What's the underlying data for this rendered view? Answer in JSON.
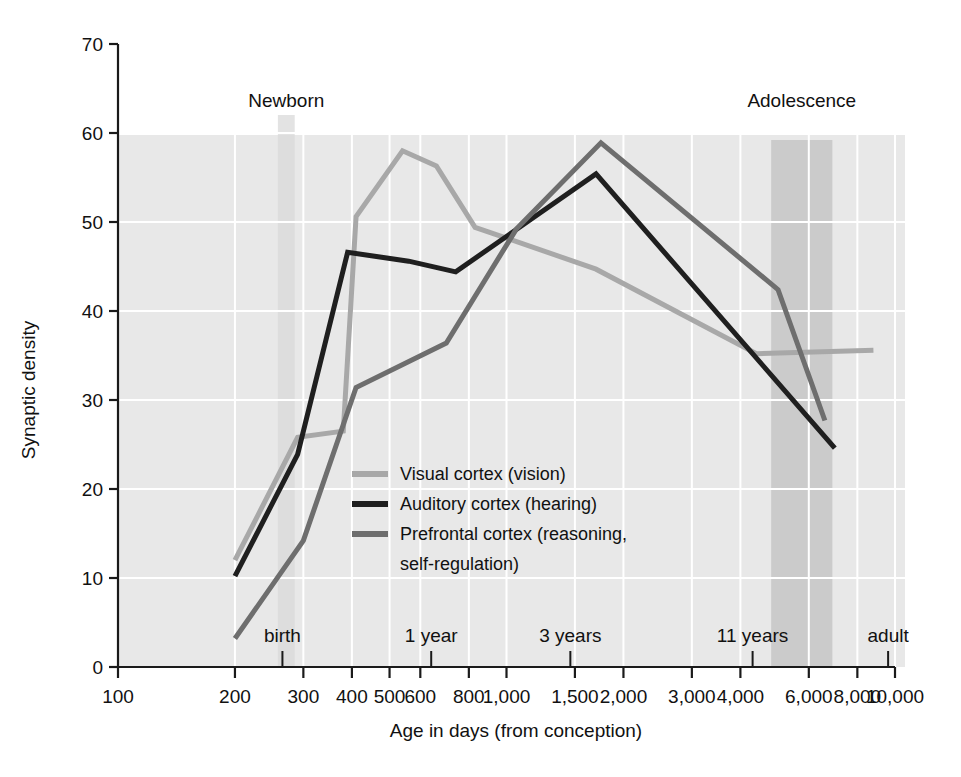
{
  "chart_data": {
    "type": "line",
    "title": "",
    "xlabel": "Age in days (from conception)",
    "ylabel": "Synaptic density",
    "xscale": "log",
    "xlim": [
      100,
      10000
    ],
    "ylim": [
      0,
      70
    ],
    "grid": true,
    "legend_position": "center-inside",
    "x_tick_labels": [
      "100",
      "200",
      "300",
      "400",
      "500",
      "600",
      "800",
      "1,000",
      "1,500",
      "2,000",
      "3,000",
      "4,000",
      "6,000",
      "8,000",
      "10,000"
    ],
    "x_tick_values": [
      100,
      200,
      300,
      400,
      500,
      600,
      800,
      1000,
      1500,
      2000,
      3000,
      4000,
      6000,
      8000,
      10000
    ],
    "y_tick_labels": [
      "0",
      "10",
      "20",
      "30",
      "40",
      "50",
      "60",
      "70"
    ],
    "y_tick_values": [
      0,
      10,
      20,
      30,
      40,
      50,
      60,
      70
    ],
    "stage_labels": [
      {
        "label": "birth",
        "x": 265
      },
      {
        "label": "1 year",
        "x": 640
      },
      {
        "label": "3 years",
        "x": 1460
      },
      {
        "label": "11 years",
        "x": 4300
      },
      {
        "label": "adult",
        "x": 9600
      }
    ],
    "bands": [
      {
        "label": "Newborn",
        "x_start": 258,
        "x_end": 285
      },
      {
        "label": "Adolescence",
        "x_start": 4800,
        "x_end": 6900
      }
    ],
    "series": [
      {
        "name": "Visual cortex (vision)",
        "color": "#a8a8a8",
        "points": [
          {
            "x": 200,
            "y": 12.0
          },
          {
            "x": 290,
            "y": 25.8
          },
          {
            "x": 380,
            "y": 26.5
          },
          {
            "x": 410,
            "y": 50.6
          },
          {
            "x": 540,
            "y": 58.0
          },
          {
            "x": 660,
            "y": 56.3
          },
          {
            "x": 830,
            "y": 49.4
          },
          {
            "x": 1000,
            "y": 48.2
          },
          {
            "x": 1700,
            "y": 44.7
          },
          {
            "x": 4400,
            "y": 35.2
          },
          {
            "x": 8800,
            "y": 35.6
          }
        ]
      },
      {
        "name": "Auditory cortex (hearing)",
        "color": "#1f1f1f",
        "points": [
          {
            "x": 200,
            "y": 10.2
          },
          {
            "x": 290,
            "y": 23.9
          },
          {
            "x": 390,
            "y": 46.6
          },
          {
            "x": 560,
            "y": 45.6
          },
          {
            "x": 740,
            "y": 44.4
          },
          {
            "x": 1040,
            "y": 48.9
          },
          {
            "x": 1700,
            "y": 55.4
          },
          {
            "x": 7000,
            "y": 24.6
          }
        ]
      },
      {
        "name": "Prefrontal cortex (reasoning, self-regulation)",
        "color": "#6e6e6e",
        "points": [
          {
            "x": 200,
            "y": 3.2
          },
          {
            "x": 300,
            "y": 14.2
          },
          {
            "x": 410,
            "y": 31.4
          },
          {
            "x": 700,
            "y": 36.4
          },
          {
            "x": 1060,
            "y": 49.2
          },
          {
            "x": 1750,
            "y": 58.9
          },
          {
            "x": 5000,
            "y": 42.4
          },
          {
            "x": 6600,
            "y": 27.7
          }
        ]
      }
    ]
  },
  "legend": {
    "items": [
      {
        "label": "Visual cortex (vision)",
        "color": "#a8a8a8"
      },
      {
        "label": "Auditory cortex (hearing)",
        "color": "#1f1f1f"
      },
      {
        "label": "Prefrontal cortex (reasoning,",
        "color": "#6e6e6e"
      },
      {
        "label": "self-regulation)",
        "color": ""
      }
    ]
  },
  "colors": {
    "plot_background": "#e8e8e8",
    "gridline": "#ffffff",
    "band_light": "#d9d9d9",
    "band_dark": "#c9c9c9",
    "axis": "#1a1a1a"
  }
}
